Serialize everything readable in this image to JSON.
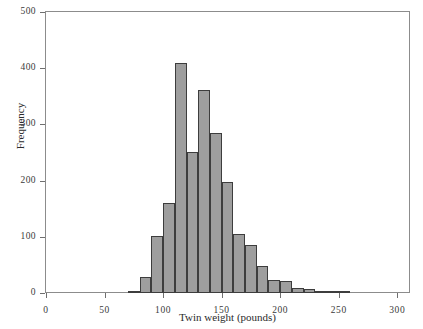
{
  "figure": {
    "title_remnant": "",
    "bar_fill_color": "#9e9e9e",
    "bar_edge_color": "#3d3d3d",
    "frame_color": "#8c8c8c"
  },
  "axes": {
    "x_title": "Twin weight (pounds)",
    "y_title": "Frequency",
    "x_ticks": [
      "0",
      "50",
      "100",
      "150",
      "200",
      "250",
      "300"
    ],
    "y_ticks": [
      "0",
      "100",
      "200",
      "300",
      "400",
      "500"
    ]
  },
  "chart_data": {
    "type": "bar",
    "title": "",
    "xlabel": "Twin weight (pounds)",
    "ylabel": "Frequency",
    "xlim": [
      0,
      310
    ],
    "ylim": [
      0,
      500
    ],
    "grid": false,
    "legend": "none",
    "bin_width": 10,
    "bin_starts": [
      70,
      80,
      90,
      100,
      110,
      120,
      130,
      140,
      150,
      160,
      170,
      180,
      190,
      200,
      210,
      220,
      230,
      240,
      250
    ],
    "categories": [
      "70-80",
      "80-90",
      "90-100",
      "100-110",
      "110-120",
      "120-130",
      "130-140",
      "140-150",
      "150-160",
      "160-170",
      "170-180",
      "180-190",
      "190-200",
      "200-210",
      "210-220",
      "220-230",
      "230-240",
      "240-250",
      "250-260"
    ],
    "values": [
      4,
      28,
      101,
      161,
      410,
      251,
      362,
      285,
      197,
      105,
      85,
      48,
      24,
      22,
      9,
      7,
      4,
      3,
      2
    ]
  }
}
